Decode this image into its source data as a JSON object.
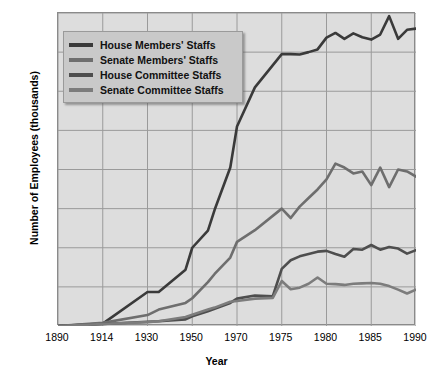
{
  "chart_data": {
    "type": "line",
    "title": "",
    "xlabel": "Year",
    "ylabel": "Number of Employees (thousands)",
    "xticks": [
      "1890",
      "1914",
      "1930",
      "1950",
      "1970",
      "1975",
      "1980",
      "1985",
      "1990"
    ],
    "xtick_values": [
      1890,
      1914,
      1930,
      1950,
      1970,
      1975,
      1980,
      1985,
      1990
    ],
    "yticks": [
      "0",
      "1",
      "2",
      "3",
      "4",
      "5",
      "6",
      "7",
      "8"
    ],
    "ylim": [
      0,
      8
    ],
    "grid": true,
    "legend_position": "top-left",
    "series": [
      {
        "name": "House Members' Staffs",
        "color": "#3a3a3a",
        "points": [
          [
            1890,
            0.0
          ],
          [
            1914,
            0.06
          ],
          [
            1930,
            0.87
          ],
          [
            1935,
            0.87
          ],
          [
            1947,
            1.44
          ],
          [
            1950,
            2.0
          ],
          [
            1957,
            2.44
          ],
          [
            1960,
            2.97
          ],
          [
            1967,
            4.05
          ],
          [
            1970,
            5.1
          ],
          [
            1972,
            6.1
          ],
          [
            1975,
            6.95
          ],
          [
            1976,
            6.95
          ],
          [
            1977,
            6.94
          ],
          [
            1978,
            7.0
          ],
          [
            1979,
            7.07
          ],
          [
            1980,
            7.37
          ],
          [
            1981,
            7.49
          ],
          [
            1982,
            7.34
          ],
          [
            1983,
            7.48
          ],
          [
            1984,
            7.38
          ],
          [
            1985,
            7.32
          ],
          [
            1986,
            7.45
          ],
          [
            1987,
            7.92
          ],
          [
            1988,
            7.34
          ],
          [
            1989,
            7.57
          ],
          [
            1990,
            7.6
          ]
        ]
      },
      {
        "name": "Senate Members' Staffs",
        "color": "#6e6e6e",
        "points": [
          [
            1890,
            0.0
          ],
          [
            1914,
            0.08
          ],
          [
            1930,
            0.28
          ],
          [
            1935,
            0.42
          ],
          [
            1947,
            0.59
          ],
          [
            1950,
            0.71
          ],
          [
            1957,
            1.12
          ],
          [
            1960,
            1.33
          ],
          [
            1967,
            1.75
          ],
          [
            1970,
            2.15
          ],
          [
            1972,
            2.45
          ],
          [
            1975,
            3.0
          ],
          [
            1976,
            2.76
          ],
          [
            1977,
            3.05
          ],
          [
            1978,
            3.27
          ],
          [
            1979,
            3.49
          ],
          [
            1980,
            3.75
          ],
          [
            1981,
            4.15
          ],
          [
            1982,
            4.05
          ],
          [
            1983,
            3.9
          ],
          [
            1984,
            3.95
          ],
          [
            1985,
            3.6
          ],
          [
            1986,
            4.05
          ],
          [
            1987,
            3.55
          ],
          [
            1988,
            4.0
          ],
          [
            1989,
            3.95
          ],
          [
            1990,
            3.82
          ]
        ]
      },
      {
        "name": "House Committee Staffs",
        "color": "#4e4e4e",
        "points": [
          [
            1890,
            0.0
          ],
          [
            1914,
            0.05
          ],
          [
            1930,
            0.11
          ],
          [
            1935,
            0.12
          ],
          [
            1947,
            0.17
          ],
          [
            1950,
            0.25
          ],
          [
            1957,
            0.375
          ],
          [
            1960,
            0.44
          ],
          [
            1967,
            0.59
          ],
          [
            1970,
            0.7
          ],
          [
            1972,
            0.78
          ],
          [
            1974,
            0.76
          ],
          [
            1975,
            1.46
          ],
          [
            1976,
            1.68
          ],
          [
            1977,
            1.78
          ],
          [
            1978,
            1.84
          ],
          [
            1979,
            1.9
          ],
          [
            1980,
            1.92
          ],
          [
            1981,
            1.84
          ],
          [
            1982,
            1.77
          ],
          [
            1983,
            1.97
          ],
          [
            1984,
            1.95
          ],
          [
            1985,
            2.07
          ],
          [
            1986,
            1.95
          ],
          [
            1987,
            2.02
          ],
          [
            1988,
            1.98
          ],
          [
            1989,
            1.85
          ],
          [
            1990,
            1.94
          ]
        ]
      },
      {
        "name": "Senate Committee Staffs",
        "color": "#7c7c7c",
        "points": [
          [
            1890,
            0.0
          ],
          [
            1914,
            0.05
          ],
          [
            1930,
            0.1
          ],
          [
            1935,
            0.12
          ],
          [
            1947,
            0.23
          ],
          [
            1950,
            0.29
          ],
          [
            1957,
            0.42
          ],
          [
            1960,
            0.47
          ],
          [
            1967,
            0.62
          ],
          [
            1970,
            0.64
          ],
          [
            1972,
            0.7
          ],
          [
            1974,
            0.72
          ],
          [
            1975,
            1.15
          ],
          [
            1976,
            0.94
          ],
          [
            1977,
            0.98
          ],
          [
            1978,
            1.08
          ],
          [
            1979,
            1.24
          ],
          [
            1980,
            1.08
          ],
          [
            1981,
            1.07
          ],
          [
            1982,
            1.05
          ],
          [
            1983,
            1.08
          ],
          [
            1984,
            1.09
          ],
          [
            1985,
            1.1
          ],
          [
            1986,
            1.08
          ],
          [
            1987,
            1.02
          ],
          [
            1988,
            0.93
          ],
          [
            1989,
            0.83
          ],
          [
            1990,
            0.93
          ]
        ]
      }
    ]
  },
  "style": {
    "plot_background": "#dddddd",
    "grid_color": "#9a9a9a",
    "border_color": "#8a8a8a",
    "legend_background": "#c9c9c9",
    "page_background": "#ffffff"
  }
}
